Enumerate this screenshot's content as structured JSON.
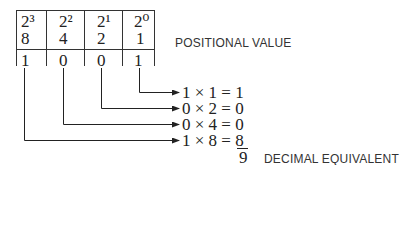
{
  "table": {
    "columns": [
      {
        "power": "2³",
        "value": "8",
        "bit": "1"
      },
      {
        "power": "2²",
        "value": "4",
        "bit": "0"
      },
      {
        "power": "2¹",
        "value": "2",
        "bit": "0"
      },
      {
        "power": "2⁰",
        "value": "1",
        "bit": "1"
      }
    ]
  },
  "labels": {
    "positional_value": "POSITIONAL VALUE",
    "decimal_equivalent": "DECIMAL EQUIVALENT"
  },
  "equations": [
    "1 × 1 = 1",
    "0 × 2 = 0",
    "0 × 4 = 0",
    "1 × 8 = 8"
  ],
  "result": "9"
}
